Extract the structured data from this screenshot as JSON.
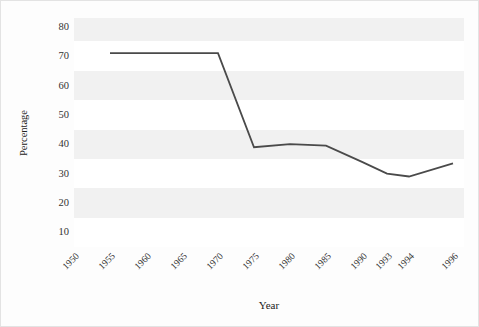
{
  "chart_data": {
    "type": "line",
    "title": "",
    "xlabel": "Year",
    "ylabel": "Percentage",
    "categories": [
      "1950",
      "1955",
      "1960",
      "1965",
      "1970",
      "1975",
      "1980",
      "1985",
      "1990",
      "1993",
      "1994",
      "1996"
    ],
    "x_positions": [
      0,
      36,
      72,
      108,
      144,
      180,
      216,
      252,
      288,
      313,
      335,
      379
    ],
    "values": [
      null,
      71,
      71,
      71,
      71,
      39,
      40,
      39.5,
      34,
      30,
      29,
      33.5
    ],
    "series": [
      {
        "name": "Percentage",
        "values": [
          null,
          71,
          71,
          71,
          71,
          39,
          40,
          39.5,
          34,
          30,
          29,
          33.5
        ],
        "color": "#4a4a4a"
      }
    ],
    "yticks": [
      10,
      20,
      30,
      40,
      50,
      60,
      70,
      80
    ],
    "ytick_labels": [
      "10",
      "20",
      "30",
      "40",
      "50",
      "60",
      "70",
      "80"
    ],
    "ylim": [
      5,
      83
    ],
    "grid": "horizontal-bands",
    "legend": "none",
    "band_color": "#f1f1f1",
    "line_color": "#4a4a4a",
    "background": "#ffffff",
    "figure_background": "#fdfdfd",
    "border_color": "#e3e3e3"
  },
  "axes": {
    "y_axis_title": "Percentage",
    "x_axis_title": "Year"
  }
}
